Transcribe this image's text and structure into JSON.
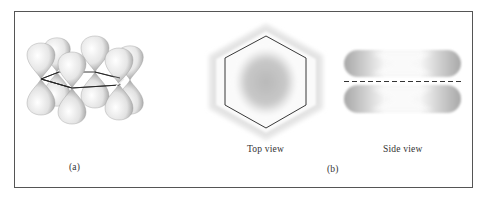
{
  "figure": {
    "panel_a": {
      "label": "(a)",
      "description": "six p orbitals perpendicular to benzene ring"
    },
    "panel_b": {
      "label": "(b)",
      "top_view": {
        "caption": "Top view"
      },
      "side_view": {
        "caption": "Side view"
      }
    }
  },
  "colors": {
    "frame": "#555555",
    "lobe_light": "#f4f4f4",
    "lobe_dark": "#9a9a9a",
    "cloud": "#b8b8b8",
    "line": "#222222"
  }
}
